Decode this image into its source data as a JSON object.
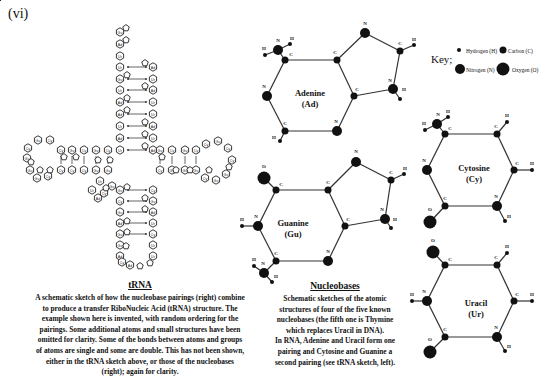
{
  "figure_label": "(vi)",
  "key": {
    "title": "Key;",
    "items": [
      {
        "label": "Hydrogen (H)",
        "size": "small"
      },
      {
        "label": "Carbon (C)",
        "size": "medium"
      },
      {
        "label": "Nitrogen (N)",
        "size": "large"
      },
      {
        "label": "Oxygen (O)",
        "size": "xlarge"
      }
    ]
  },
  "molecules": {
    "adenine": {
      "name": "Adenine",
      "abbr": "(Ad)"
    },
    "guanine": {
      "name": "Guanine",
      "abbr": "(Gu)"
    },
    "cytosine": {
      "name": "Cytosine",
      "abbr": "(Cy)"
    },
    "uracil": {
      "name": "Uracil",
      "abbr": "(Ur)"
    }
  },
  "trna_caption": {
    "title": "tRNA",
    "text": "A schematic sketch of how the nucleobase pairings (right) combine to produce a transfer RiboNucleic Acid (tRNA) structure. The example shown here is invented, with random ordering for the pairings. Some additional atoms and small structures have been omitted for clarity. Some of the bonds between atoms and groups of atoms are single and some are double. This has not been shown, either in the tRNA sketch above, or those of the nucleobases (right); again for clarity."
  },
  "nucleobases_caption": {
    "title": "Nucleobases",
    "text1": "Schematic sketches of the atomic structures of four of the five known nucleobases (the fifth one is Thymine which replaces Uracil in DNA).",
    "text2": "In RNA, Adenine and Uracil form one pairing and Cytosine and Guanine a second pairing (see tRNA sketch, left)."
  },
  "trna_nodes": {
    "top_stem_left": [
      "Gu",
      "Ad",
      "Ur",
      "Ur",
      "Gu",
      "Ur",
      "Ad",
      "Ad",
      "Ur",
      "Ad",
      "Ur",
      "Cy"
    ],
    "top_stem_right": [
      "Ad",
      "Ur",
      "Ad",
      "Ur",
      "Ur",
      "Ad",
      "Ur",
      "Ad",
      "Gu"
    ],
    "bottom_stem_left": [
      "Gu",
      "Cy",
      "Gu",
      "Ad",
      "Gu",
      "Gu",
      "Ad",
      "Cy"
    ],
    "bottom_stem_right": [
      "Cy",
      "Gu",
      "Ad",
      "Ur",
      "Cy",
      "Ur",
      "Ur",
      "Cy"
    ],
    "bottom_loop": [
      "Ad"
    ],
    "left_arm_top": [
      "Cy",
      "Gu",
      "Cy",
      "Gu",
      "Cy"
    ],
    "left_arm_bottom": [
      "Cy",
      "Cy",
      "Cy",
      "Gu",
      "Gu"
    ],
    "left_loop": [
      "Cy",
      "Gu",
      "Cy",
      "Gu",
      "Gu",
      "Gu"
    ],
    "right_arm_top": [
      "Gu",
      "Cy",
      "Gu",
      "Cy"
    ],
    "right_arm_bottom": [
      "Cy",
      "Gu",
      "Gu",
      "Gu"
    ],
    "right_loop": [
      "Cy",
      "Gu",
      "Cy",
      "Cy",
      "Gu",
      "Gu",
      "Cy",
      "Gu"
    ],
    "junction": [
      "Ur",
      "Ur",
      "Cy",
      "Gu",
      "Ad"
    ]
  }
}
